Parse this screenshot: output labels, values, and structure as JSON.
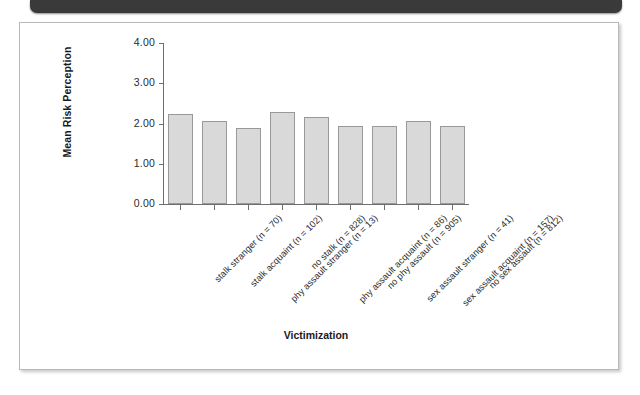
{
  "chart_data": {
    "type": "bar",
    "title": "",
    "xlabel": "Victimization",
    "ylabel": "Mean Risk Perception",
    "ylim": [
      0.0,
      4.0
    ],
    "ytick_labels": [
      "4.00",
      "3.00",
      "2.00",
      "1.00",
      "0.00"
    ],
    "ytick_values": [
      4.0,
      3.0,
      2.0,
      1.0,
      0.0
    ],
    "grid": false,
    "legend": "none",
    "bar_fill_color": "#d9d9d9",
    "bar_edge_color": "#999999",
    "categories": [
      "stalk stranger (n = 70)",
      "stalk acquaint (n = 102)",
      "phy assault stranger (n = 13)",
      "no stalk (n = 828)",
      "phy assault acquaint (n = 86)",
      "no phy assault (n = 905)",
      "sex assault stranger (n = 41)",
      "sex assault acquaint (n = 157)",
      "no sex assault (n = 812)"
    ],
    "values": [
      2.23,
      2.07,
      1.9,
      2.28,
      2.16,
      1.95,
      1.95,
      2.06,
      1.94
    ]
  }
}
